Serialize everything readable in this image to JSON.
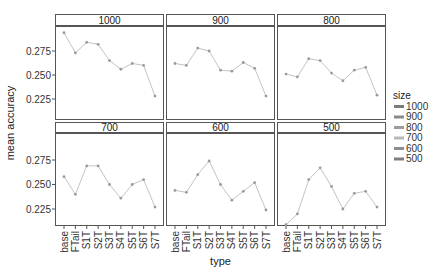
{
  "chart_data": {
    "type": "line",
    "facet_by": "size",
    "xlabel": "type",
    "ylabel": "mean accuracy",
    "categories": [
      "base",
      "FTail",
      "S1T",
      "S2T",
      "S3T",
      "S4T",
      "S5T",
      "S6T",
      "S7T"
    ],
    "yticks": [
      0.225,
      0.25,
      0.275
    ],
    "ytick_labels": [
      "0.225",
      "0.250",
      "0.275"
    ],
    "ylim": [
      0.205,
      0.298
    ],
    "grid": false,
    "legend": {
      "title": "size",
      "position": "right",
      "entries": [
        {
          "label": "1000",
          "color": "#7a7a7a"
        },
        {
          "label": "900",
          "color": "#8a8a8a"
        },
        {
          "label": "800",
          "color": "#9c9c9c"
        },
        {
          "label": "700",
          "color": "#b8b8b8"
        },
        {
          "label": "600",
          "color": "#8e8e8e"
        },
        {
          "label": "500",
          "color": "#7e7e7e"
        }
      ]
    },
    "series": [
      {
        "name": "1000",
        "values": [
          0.294,
          0.273,
          0.284,
          0.282,
          0.265,
          0.256,
          0.262,
          0.26,
          0.228
        ]
      },
      {
        "name": "900",
        "values": [
          0.262,
          0.26,
          0.278,
          0.275,
          0.255,
          0.254,
          0.263,
          0.257,
          0.228
        ]
      },
      {
        "name": "800",
        "values": [
          0.251,
          0.248,
          0.267,
          0.265,
          0.252,
          0.244,
          0.255,
          0.258,
          0.229
        ]
      },
      {
        "name": "700",
        "values": [
          0.258,
          0.24,
          0.269,
          0.269,
          0.25,
          0.236,
          0.25,
          0.255,
          0.227
        ]
      },
      {
        "name": "600",
        "values": [
          0.244,
          0.242,
          0.26,
          0.274,
          0.25,
          0.234,
          0.243,
          0.252,
          0.224
        ]
      },
      {
        "name": "500",
        "values": [
          0.209,
          0.22,
          0.255,
          0.267,
          0.248,
          0.225,
          0.241,
          0.243,
          0.227
        ]
      }
    ]
  }
}
